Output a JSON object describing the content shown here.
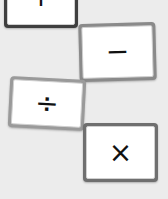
{
  "scene": {
    "description": "Four math operator cards on a light gray background",
    "background": "#ececec"
  },
  "cards": [
    {
      "id": "plus",
      "symbol": "+",
      "label": "plus"
    },
    {
      "id": "minus",
      "symbol": "−",
      "label": "minus"
    },
    {
      "id": "divide",
      "symbol": "÷",
      "label": "divide"
    },
    {
      "id": "times",
      "symbol": "×",
      "label": "times"
    }
  ]
}
